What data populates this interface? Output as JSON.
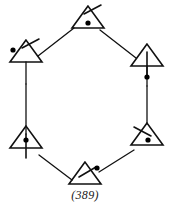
{
  "figure": {
    "caption": "(389)",
    "colors": {
      "ink": "#111111",
      "background": "#ffffff",
      "dot": "#000000"
    },
    "geometry": {
      "width": 170,
      "height": 213,
      "stroke_width": 1.6,
      "edge_stroke_width": 1.3,
      "triangle_half_width": 16,
      "triangle_height": 22,
      "dot_radius": 2.6
    },
    "nodes": [
      {
        "id": "node-top",
        "name": "triangle-top",
        "cx": 88,
        "cy": 28,
        "dot_inside": true,
        "dot_inside_dx": 0,
        "dot_inside_dy": -5,
        "tick": {
          "type": "slash",
          "x1": 84,
          "y1": 14,
          "x2": 101,
          "y2": 5
        },
        "stem": {
          "present": false
        }
      },
      {
        "id": "node-upper-left",
        "name": "triangle-upper-left",
        "cx": 26,
        "cy": 62,
        "dot_inside": false,
        "tick": {
          "type": "slash",
          "x1": 22,
          "y1": 48,
          "x2": 39,
          "y2": 39
        },
        "external_dot": {
          "cx": 13,
          "cy": 50
        },
        "stem": {
          "present": true,
          "top": 62,
          "bottom": 84
        }
      },
      {
        "id": "node-upper-right",
        "name": "triangle-upper-right",
        "cx": 147,
        "cy": 66,
        "dot_inside": false,
        "tick": {
          "type": "none"
        },
        "axis": {
          "x": 147,
          "y1": 52,
          "y2": 78
        },
        "external_dot": {
          "cx": 147,
          "cy": 77
        },
        "stem": {
          "present": true,
          "top": 66,
          "bottom": 86
        }
      },
      {
        "id": "node-lower-right",
        "name": "triangle-lower-right",
        "cx": 147,
        "cy": 145,
        "dot_inside": true,
        "dot_inside_dx": 1,
        "dot_inside_dy": -5,
        "tick": {
          "type": "slash",
          "x1": 134,
          "y1": 127,
          "x2": 151,
          "y2": 136
        },
        "stem": {
          "present": false
        }
      },
      {
        "id": "node-bottom",
        "name": "triangle-bottom",
        "cx": 85,
        "cy": 184,
        "dot_inside": false,
        "tick": {
          "type": "slash",
          "x1": 79,
          "y1": 177,
          "x2": 96,
          "y2": 167
        },
        "external_dot": {
          "cx": 97,
          "cy": 168
        },
        "stem": {
          "present": false
        }
      },
      {
        "id": "node-lower-left",
        "name": "triangle-lower-left",
        "cx": 26,
        "cy": 148,
        "dot_inside": true,
        "dot_inside_dx": 0,
        "dot_inside_dy": -8,
        "tick": {
          "type": "none"
        },
        "axis": {
          "x": 26,
          "y1": 134,
          "y2": 158
        },
        "stem": {
          "present": false
        }
      }
    ],
    "edges": [
      {
        "id": "edge-upper-left-to-top",
        "name": "edge-upper-left-top",
        "x1": 38,
        "y1": 56,
        "x2": 74,
        "y2": 28
      },
      {
        "id": "edge-top-to-upper-right",
        "name": "edge-top-upper-right",
        "x1": 100,
        "y1": 30,
        "x2": 136,
        "y2": 58
      },
      {
        "id": "edge-upper-right-to-lower-right",
        "name": "edge-right-vertical",
        "x1": 147,
        "y1": 86,
        "x2": 147,
        "y2": 124
      },
      {
        "id": "edge-lower-right-to-bottom",
        "name": "edge-lower-right-bottom",
        "x1": 134,
        "y1": 150,
        "x2": 99,
        "y2": 172
      },
      {
        "id": "edge-bottom-to-lower-left",
        "name": "edge-bottom-lower-left",
        "x1": 72,
        "y1": 180,
        "x2": 39,
        "y2": 155
      },
      {
        "id": "edge-lower-left-to-upper-left",
        "name": "edge-left-vertical",
        "x1": 26,
        "y1": 84,
        "x2": 26,
        "y2": 134
      }
    ]
  }
}
